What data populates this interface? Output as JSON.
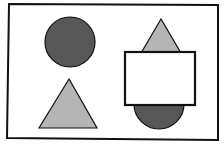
{
  "diagram": {
    "width": 224,
    "height": 149,
    "background": "#ffffff",
    "stroke": "#111111",
    "colors": {
      "dark_fill": "#575757",
      "light_fill": "#b5b5b5",
      "white_fill": "#ffffff"
    },
    "frame": {
      "points": "9,4 218,5 218,140 7,138",
      "stroke_width": 2
    },
    "shapes": [
      {
        "id": "circle-top-left",
        "type": "circle",
        "cx": 70,
        "cy": 42,
        "r": 25,
        "fill": "dark"
      },
      {
        "id": "triangle-bottom-left",
        "type": "triangle",
        "points": "69,79 39,128 97,128",
        "fill": "light"
      },
      {
        "id": "triangle-top-right",
        "type": "triangle",
        "points": "161,19 137,60 185,60",
        "fill": "light"
      },
      {
        "id": "half-circle-bottom-right",
        "type": "circle",
        "cx": 159,
        "cy": 104,
        "r": 25,
        "fill": "dark"
      },
      {
        "id": "rectangle-right",
        "type": "rect",
        "x": 125,
        "y": 52,
        "width": 70,
        "height": 53,
        "fill": "white"
      }
    ]
  }
}
